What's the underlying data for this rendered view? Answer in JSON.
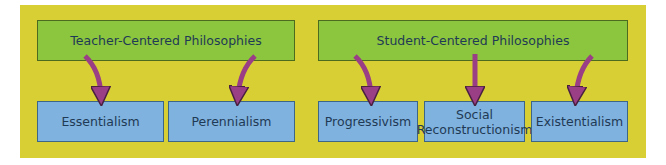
{
  "diagram": {
    "colors": {
      "background_panel": "#d8cf34",
      "category_box": "#8cc63e",
      "philosophy_box": "#7fb2de",
      "arrow": "#9a3e86",
      "text": "#1f3a55"
    },
    "categories": [
      {
        "label": "Teacher-Centered Philosophies",
        "philosophies": [
          "Essentialism",
          "Perennialism"
        ]
      },
      {
        "label": "Student-Centered Philosophies",
        "philosophies": [
          "Progressivism",
          "Social Reconstructionism",
          "Existentialism"
        ]
      }
    ],
    "nodes": {
      "teacher": "Teacher-Centered Philosophies",
      "student": "Student-Centered Philosophies",
      "essentialism": "Essentialism",
      "perennialism": "Perennialism",
      "progressivism": "Progressivism",
      "social_line1": "Social",
      "social_line2": "Reconstructionism",
      "existentialism": "Existentialism"
    }
  }
}
